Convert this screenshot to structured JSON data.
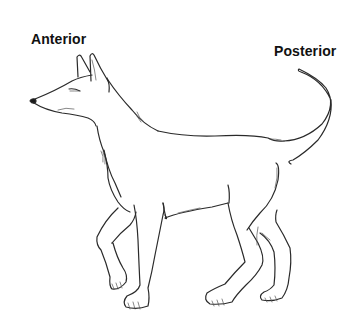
{
  "figure": {
    "labels": {
      "anterior": "Anterior",
      "posterior": "Posterior"
    },
    "colors": {
      "background": "#ffffff",
      "line": "#2a2a2a",
      "text": "#111111"
    }
  }
}
